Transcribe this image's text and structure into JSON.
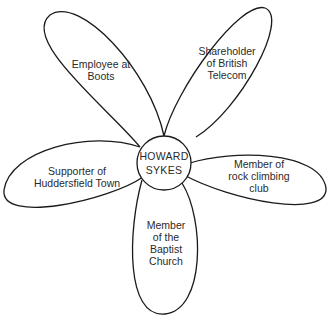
{
  "diagram": {
    "type": "identity-flower",
    "center": {
      "label": "HOWARD\nSYKES"
    },
    "petals": [
      {
        "id": "top-left",
        "label": "Employee at\nBoots"
      },
      {
        "id": "top-right",
        "label": "Shareholder\nof British\nTelecom"
      },
      {
        "id": "right",
        "label": "Member of\nrock climbing\nclub"
      },
      {
        "id": "bottom",
        "label": "Member\nof the\nBaptist\nChurch"
      },
      {
        "id": "left",
        "label": "Supporter of\nHuddersfield Town"
      }
    ],
    "colors": {
      "stroke": "#1a1a1a",
      "fill": "#ffffff",
      "text": "#2a2a2a"
    }
  }
}
